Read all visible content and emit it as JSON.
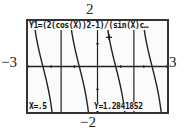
{
  "window": {
    "xmin_label": "−3",
    "xmax_label": "3",
    "ymin_label": "−2",
    "ymax_label": "2"
  },
  "screen": {
    "equation": "Y1=(2(cos(X))2-1)/(sin(X)c…",
    "trace_x": "X=.5",
    "trace_y": "Y=1.2841852",
    "cursor": "plus-cursor"
  },
  "chart_data": {
    "type": "line",
    "xlabel": "",
    "ylabel": "",
    "xlim": [
      -3,
      3
    ],
    "ylim": [
      -2,
      2
    ],
    "x_tick_labels": [
      "-3",
      "3"
    ],
    "y_tick_labels": [
      "-2",
      "2"
    ],
    "grid": false,
    "series": [
      {
        "name": "Y1",
        "function": "2cot(2x)",
        "asymptotes": [
          -1.5708,
          0,
          1.5708
        ]
      }
    ],
    "trace": {
      "x": 0.5,
      "y": 1.2841852
    }
  }
}
